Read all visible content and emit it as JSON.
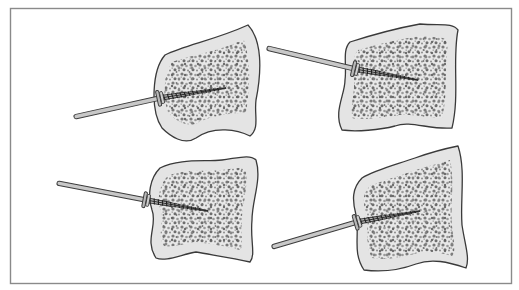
{
  "figure": {
    "frame_color": "#8a8a8a",
    "colors": {
      "cortex_fill": "#e4e4e4",
      "outline": "#3a3a3a",
      "cancellous_dark": "#6e6e6e",
      "cancellous_mid": "#9a9a9a",
      "pin_fill": "#c8c8c8",
      "pin_outline": "#3c3c3c"
    },
    "panels": [
      {
        "id": "top-left",
        "bone_path": "M165,55 C185,45 215,40 248,25 C262,40 262,70 256,100 C254,115 260,128 250,136 C238,130 214,125 196,138 C184,146 170,136 162,128 C150,110 152,70 165,55 Z",
        "core_path": "M172,62 C192,55 215,52 244,40 C251,60 250,90 246,112 C236,114 214,113 196,124 C184,126 174,120 168,112 C162,95 164,75 172,62 Z",
        "pin": {
          "x1": 74,
          "y1": 117,
          "x2": 160,
          "y2": 98
        },
        "head": {
          "x": 160,
          "y": 98
        },
        "tip": {
          "x": 226,
          "y": 88
        }
      },
      {
        "id": "top-right",
        "bone_path": "M350,42 C372,35 398,28 420,24 C440,26 452,22 458,30 C452,60 460,95 452,128 C430,130 410,120 395,126 C380,130 356,132 342,130 C333,112 345,95 345,80 C347,65 342,50 350,42 Z",
        "core_path": "M358,50 C380,44 402,38 422,36 C440,38 447,36 448,44 C444,70 448,96 442,118 C425,118 408,112 394,116 C380,118 364,120 352,118 C350,104 355,94 354,80 C355,66 352,56 358,50 Z",
        "pin": {
          "x1": 267,
          "y1": 48,
          "x2": 355,
          "y2": 69
        },
        "head": {
          "x": 355,
          "y": 69
        },
        "tip": {
          "x": 418,
          "y": 80
        }
      },
      {
        "id": "bottom-left",
        "bone_path": "M160,168 C180,158 205,162 222,160 C238,158 250,154 256,160 C262,180 252,200 252,220 C250,240 256,255 250,262 C232,258 212,255 196,252 C180,255 165,262 156,258 C144,240 158,225 152,210 C147,195 150,178 160,168 Z",
        "core_path": "M168,176 C186,168 206,172 222,170 C236,168 244,166 246,172 C248,190 242,205 242,220 C240,236 244,246 240,250 C226,246 210,244 196,242 C182,244 170,248 164,246 C156,232 166,220 160,208 C157,196 160,184 168,176 Z",
        "pin": {
          "x1": 57,
          "y1": 183,
          "x2": 146,
          "y2": 200
        },
        "head": {
          "x": 146,
          "y": 200
        },
        "tip": {
          "x": 208,
          "y": 211
        }
      },
      {
        "id": "bottom-right",
        "bone_path": "M362,178 C375,170 395,165 415,158 C432,152 448,148 458,146 C466,170 460,200 462,225 C465,245 470,258 466,268 C448,262 432,258 416,264 C400,270 380,272 364,270 C352,252 360,235 356,215 C352,200 352,188 362,178 Z",
        "core_path": "M370,186 C384,180 400,176 416,170 C432,165 444,162 450,160 C455,182 450,206 452,226 C454,242 456,252 452,256 C438,252 426,250 414,254 C400,258 384,260 372,258 C364,244 370,230 366,214 C363,202 362,194 370,186 Z",
        "pin": {
          "x1": 272,
          "y1": 247,
          "x2": 357,
          "y2": 222
        },
        "head": {
          "x": 357,
          "y": 222
        },
        "tip": {
          "x": 420,
          "y": 211
        }
      }
    ]
  }
}
